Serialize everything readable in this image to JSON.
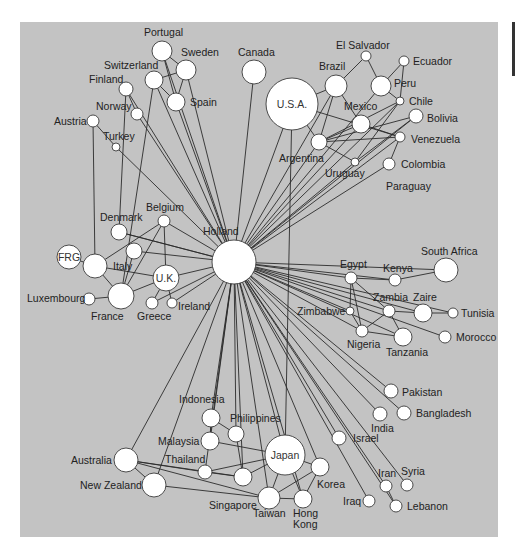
{
  "diagram": {
    "type": "network",
    "hub": "Holland",
    "colors": {
      "background": "#c3c3c3",
      "node_fill": "#ffffff",
      "edge": "#2b2b2b"
    },
    "nodes": [
      {
        "id": "holland",
        "label": "Holland",
        "x": 234,
        "y": 262,
        "r": 22,
        "lx": 203,
        "ly": 235,
        "inside": false
      },
      {
        "id": "portugal",
        "label": "Portugal",
        "x": 162,
        "y": 51,
        "r": 10,
        "lx": 144,
        "ly": 36,
        "inside": false
      },
      {
        "id": "sweden",
        "label": "Sweden",
        "x": 186,
        "y": 70,
        "r": 10,
        "lx": 181,
        "ly": 56,
        "inside": false
      },
      {
        "id": "switzerland",
        "label": "Switzerland",
        "x": 154,
        "y": 80,
        "r": 9,
        "lx": 104,
        "ly": 69,
        "inside": false
      },
      {
        "id": "finland",
        "label": "Finland",
        "x": 126,
        "y": 89,
        "r": 7,
        "lx": 89,
        "ly": 83,
        "inside": false
      },
      {
        "id": "spain",
        "label": "Spain",
        "x": 176,
        "y": 102,
        "r": 9,
        "lx": 190,
        "ly": 106,
        "inside": false
      },
      {
        "id": "norway",
        "label": "Norway",
        "x": 137,
        "y": 114,
        "r": 6,
        "lx": 96,
        "ly": 110,
        "inside": false
      },
      {
        "id": "austria",
        "label": "Austria",
        "x": 93,
        "y": 121,
        "r": 6,
        "lx": 54,
        "ly": 125,
        "inside": false
      },
      {
        "id": "turkey",
        "label": "Turkey",
        "x": 116,
        "y": 147,
        "r": 4,
        "lx": 103,
        "ly": 140,
        "inside": false
      },
      {
        "id": "canada",
        "label": "Canada",
        "x": 254,
        "y": 72,
        "r": 12,
        "lx": 238,
        "ly": 56,
        "inside": false
      },
      {
        "id": "usa",
        "label": "U.S.A.",
        "x": 292,
        "y": 104,
        "r": 26,
        "lx": 292,
        "ly": 104,
        "inside": true
      },
      {
        "id": "el_salvador",
        "label": "El Salvador",
        "x": 366,
        "y": 56,
        "r": 5,
        "lx": 336,
        "ly": 49,
        "inside": false
      },
      {
        "id": "ecuador",
        "label": "Ecuador",
        "x": 404,
        "y": 61,
        "r": 5,
        "lx": 413,
        "ly": 65,
        "inside": false
      },
      {
        "id": "brazil",
        "label": "Brazil",
        "x": 336,
        "y": 86,
        "r": 11,
        "lx": 319,
        "ly": 70,
        "inside": false
      },
      {
        "id": "peru",
        "label": "Peru",
        "x": 381,
        "y": 86,
        "r": 10,
        "lx": 394,
        "ly": 87,
        "inside": false
      },
      {
        "id": "chile",
        "label": "Chile",
        "x": 400,
        "y": 101,
        "r": 4,
        "lx": 409,
        "ly": 105,
        "inside": false
      },
      {
        "id": "mexico",
        "label": "Mexico",
        "x": 361,
        "y": 124,
        "r": 9,
        "lx": 344,
        "ly": 110,
        "inside": false
      },
      {
        "id": "bolivia",
        "label": "Bolivia",
        "x": 416,
        "y": 116,
        "r": 7,
        "lx": 427,
        "ly": 122,
        "inside": false
      },
      {
        "id": "argentina",
        "label": "Argentina",
        "x": 319,
        "y": 142,
        "r": 8,
        "lx": 279,
        "ly": 162,
        "inside": false
      },
      {
        "id": "venezuela",
        "label": "Venezuela",
        "x": 400,
        "y": 137,
        "r": 5,
        "lx": 411,
        "ly": 143,
        "inside": false
      },
      {
        "id": "uruguay",
        "label": "Uruguay",
        "x": 355,
        "y": 162,
        "r": 4,
        "lx": 325,
        "ly": 177,
        "inside": false
      },
      {
        "id": "colombia",
        "label": "Colombia",
        "x": 389,
        "y": 164,
        "r": 6,
        "lx": 401,
        "ly": 168,
        "inside": false
      },
      {
        "id": "paraguay",
        "label": "Paraguay",
        "x": null,
        "y": null,
        "r": 0,
        "lx": 386,
        "ly": 190,
        "inside": false
      },
      {
        "id": "belgium",
        "label": "Belgium",
        "x": 164,
        "y": 221,
        "r": 6,
        "lx": 146,
        "ly": 211,
        "inside": false
      },
      {
        "id": "denmark",
        "label": "Denmark",
        "x": 119,
        "y": 232,
        "r": 8,
        "lx": 100,
        "ly": 221,
        "inside": false
      },
      {
        "id": "italy_small",
        "label": "",
        "x": 134,
        "y": 251,
        "r": 8,
        "lx": 0,
        "ly": 0,
        "inside": false
      },
      {
        "id": "frg",
        "label": "FRG",
        "x": 69,
        "y": 257,
        "r": 12,
        "lx": 69,
        "ly": 257,
        "inside": true
      },
      {
        "id": "italy",
        "label": "Italy",
        "x": 95,
        "y": 266,
        "r": 12,
        "lx": 113,
        "ly": 270,
        "inside": false
      },
      {
        "id": "uk",
        "label": "U.K.",
        "x": 166,
        "y": 278,
        "r": 13,
        "lx": 166,
        "ly": 278,
        "inside": true
      },
      {
        "id": "luxembourg",
        "label": "Luxembourg",
        "x": 89,
        "y": 299,
        "r": 6,
        "lx": 27,
        "ly": 302,
        "inside": false
      },
      {
        "id": "france",
        "label": "France",
        "x": 121,
        "y": 296,
        "r": 13,
        "lx": 91,
        "ly": 320,
        "inside": false
      },
      {
        "id": "greece",
        "label": "Greece",
        "x": 152,
        "y": 303,
        "r": 6,
        "lx": 137,
        "ly": 320,
        "inside": false
      },
      {
        "id": "ireland",
        "label": "Ireland",
        "x": 172,
        "y": 303,
        "r": 5,
        "lx": 178,
        "ly": 310,
        "inside": false
      },
      {
        "id": "egypt",
        "label": "Egypt",
        "x": 351,
        "y": 278,
        "r": 6,
        "lx": 340,
        "ly": 268,
        "inside": false
      },
      {
        "id": "kenya",
        "label": "Kenya",
        "x": 395,
        "y": 280,
        "r": 6,
        "lx": 383,
        "ly": 272,
        "inside": false
      },
      {
        "id": "south_africa",
        "label": "South Africa",
        "x": 446,
        "y": 270,
        "r": 12,
        "lx": 421,
        "ly": 255,
        "inside": false
      },
      {
        "id": "zambia",
        "label": "Zambia",
        "x": 389,
        "y": 311,
        "r": 6,
        "lx": 373,
        "ly": 301,
        "inside": false
      },
      {
        "id": "zaire",
        "label": "Zaire",
        "x": 423,
        "y": 313,
        "r": 9,
        "lx": 413,
        "ly": 301,
        "inside": false
      },
      {
        "id": "tunisia",
        "label": "Tunisia",
        "x": 453,
        "y": 313,
        "r": 5,
        "lx": 461,
        "ly": 317,
        "inside": false
      },
      {
        "id": "zimbabwe",
        "label": "Zimbabwe",
        "x": 350,
        "y": 311,
        "r": 4,
        "lx": 297,
        "ly": 315,
        "inside": false
      },
      {
        "id": "nigeria",
        "label": "Nigeria",
        "x": 362,
        "y": 331,
        "r": 6,
        "lx": 347,
        "ly": 348,
        "inside": false
      },
      {
        "id": "tanzania",
        "label": "Tanzania",
        "x": 403,
        "y": 337,
        "r": 9,
        "lx": 386,
        "ly": 356,
        "inside": false
      },
      {
        "id": "morocco",
        "label": "Morocco",
        "x": 445,
        "y": 337,
        "r": 6,
        "lx": 456,
        "ly": 341,
        "inside": false
      },
      {
        "id": "pakistan",
        "label": "Pakistan",
        "x": 391,
        "y": 391,
        "r": 7,
        "lx": 402,
        "ly": 396,
        "inside": false
      },
      {
        "id": "india",
        "label": "India",
        "x": 380,
        "y": 414,
        "r": 7,
        "lx": 371,
        "ly": 432,
        "inside": false
      },
      {
        "id": "bangladesh",
        "label": "Bangladesh",
        "x": 404,
        "y": 413,
        "r": 7,
        "lx": 416,
        "ly": 417,
        "inside": false
      },
      {
        "id": "israel",
        "label": "Israel",
        "x": 339,
        "y": 438,
        "r": 7,
        "lx": 353,
        "ly": 442,
        "inside": false
      },
      {
        "id": "iran",
        "label": "Iran",
        "x": 386,
        "y": 486,
        "r": 6,
        "lx": 378,
        "ly": 477,
        "inside": false
      },
      {
        "id": "syria",
        "label": "Syria",
        "x": 407,
        "y": 485,
        "r": 6,
        "lx": 401,
        "ly": 475,
        "inside": false
      },
      {
        "id": "iraq",
        "label": "Iraq",
        "x": 369,
        "y": 501,
        "r": 6,
        "lx": 343,
        "ly": 505,
        "inside": false
      },
      {
        "id": "lebanon",
        "label": "Lebanon",
        "x": 396,
        "y": 506,
        "r": 6,
        "lx": 407,
        "ly": 510,
        "inside": false
      },
      {
        "id": "indonesia",
        "label": "Indonesia",
        "x": 211,
        "y": 418,
        "r": 9,
        "lx": 179,
        "ly": 403,
        "inside": false
      },
      {
        "id": "philippines",
        "label": "Philippines",
        "x": 236,
        "y": 434,
        "r": 8,
        "lx": 230,
        "ly": 422,
        "inside": false
      },
      {
        "id": "malaysia",
        "label": "Malaysia",
        "x": 210,
        "y": 441,
        "r": 9,
        "lx": 158,
        "ly": 445,
        "inside": false
      },
      {
        "id": "japan",
        "label": "Japan",
        "x": 285,
        "y": 455,
        "r": 20,
        "lx": 285,
        "ly": 455,
        "inside": true
      },
      {
        "id": "australia",
        "label": "Australia",
        "x": 126,
        "y": 460,
        "r": 12,
        "lx": 71,
        "ly": 464,
        "inside": false
      },
      {
        "id": "thailand",
        "label": "Thailand",
        "x": 205,
        "y": 472,
        "r": 7,
        "lx": 165,
        "ly": 463,
        "inside": false
      },
      {
        "id": "korea",
        "label": "Korea",
        "x": 320,
        "y": 467,
        "r": 9,
        "lx": 317,
        "ly": 488,
        "inside": false
      },
      {
        "id": "nz_mid",
        "label": "",
        "x": 243,
        "y": 478,
        "r": 8,
        "lx": 0,
        "ly": 0,
        "inside": false
      },
      {
        "id": "new_zealand",
        "label": "New Zealand",
        "x": 154,
        "y": 485,
        "r": 12,
        "lx": 80,
        "ly": 489,
        "inside": false
      },
      {
        "id": "singapore",
        "label": "Singapore",
        "x": 270,
        "y": 497,
        "r": 9,
        "lx": 209,
        "ly": 509,
        "inside": false
      },
      {
        "id": "taiwan",
        "label": "Taiwan",
        "x": 300,
        "y": 499,
        "r": 8,
        "lx": 253,
        "ly": 517,
        "inside": false
      },
      {
        "id": "hong_kong",
        "label": "Hong\nKong",
        "x": 303,
        "y": 499,
        "r": 0,
        "lx": 292,
        "ly": 517,
        "inside": false
      }
    ]
  },
  "labels": {
    "paraguay": "Paraguay",
    "hong": "Hong",
    "kong": "Kong"
  }
}
